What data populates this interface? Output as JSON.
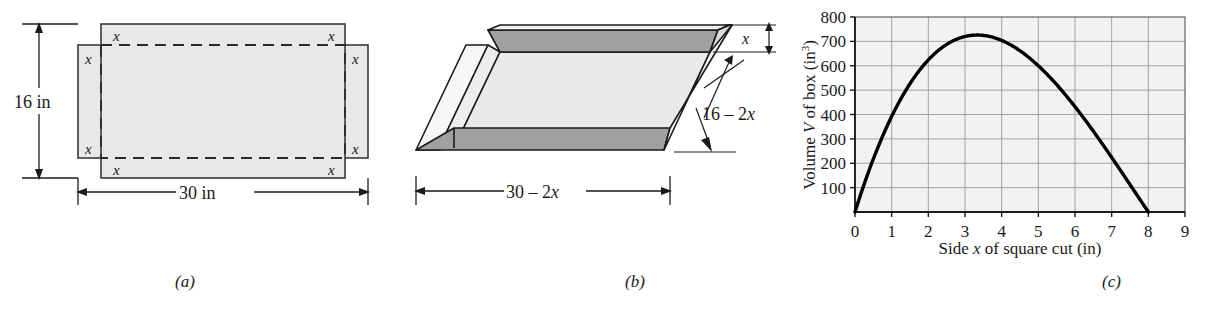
{
  "figure": {
    "caption_a": "(a)",
    "caption_b": "(b)",
    "caption_c": "(c)"
  },
  "panel_a": {
    "title": "flat sheet with squares cut from corners",
    "height_label": "16 in",
    "width_label": "30 in",
    "corner_labels": [
      "x",
      "x",
      "x",
      "x",
      "x",
      "x",
      "x",
      "x"
    ],
    "colors": {
      "fill": "#e8e8e8",
      "stroke": "#3a3a3a",
      "dash": "#2a2a2a"
    }
  },
  "panel_b": {
    "title": "open box folded from sheet",
    "height_label": "x",
    "depth_label": "16 – 2x",
    "depth_label_num": "16",
    "depth_label_minus": " – 2",
    "depth_label_var": "x",
    "width_label": "30 – 2x",
    "width_label_num": "30",
    "width_label_minus": " – 2",
    "width_label_var": "x",
    "colors": {
      "top_face": "#e9e9e9",
      "wall_face": "#a0a0a0",
      "outer_face": "#f2f2f2",
      "stroke": "#1a1a1a"
    }
  },
  "chart_data": {
    "type": "line",
    "title": "",
    "xlabel": "Side x of square cut (in)",
    "xlabel_pre": "Side ",
    "xlabel_var": "x",
    "xlabel_post": " of square cut (in)",
    "ylabel": "Volume V of box (in³)",
    "ylabel_pre": "Volume ",
    "ylabel_var": "V",
    "ylabel_post": " of box (in",
    "ylabel_sup": "3",
    "ylabel_end": ")",
    "xlim": [
      0,
      9
    ],
    "ylim": [
      0,
      800
    ],
    "xticks": [
      "0",
      "1",
      "2",
      "3",
      "4",
      "5",
      "6",
      "7",
      "8",
      "9"
    ],
    "yticks": [
      "100",
      "200",
      "300",
      "400",
      "500",
      "600",
      "700",
      "800"
    ],
    "grid": true,
    "legend": "none",
    "curve_formula": "V = x(30-2x)(16-2x)",
    "x": [
      0,
      0.25,
      0.5,
      0.75,
      1,
      1.25,
      1.5,
      1.75,
      2,
      2.25,
      2.5,
      2.75,
      3,
      3.25,
      3.5,
      3.75,
      4,
      4.25,
      4.5,
      4.75,
      5,
      5.25,
      5.5,
      5.75,
      6,
      6.25,
      6.5,
      6.75,
      7,
      7.25,
      7.5,
      7.75,
      8
    ],
    "y": [
      0,
      108.1,
      203.0,
      285.4,
      356.0,
      415.3,
      464.0,
      502.7,
      532.0,
      552.6,
      565.0,
      569.9,
      568.0,
      560.0,
      546.5,
      528.2,
      505.8,
      479.9,
      451.1,
      420.2,
      387.8,
      354.5,
      321.0,
      287.9,
      255.9,
      225.6,
      197.7,
      172.8,
      151.5,
      134.5,
      122.4,
      115.9,
      115.5
    ],
    "curve_points_scaled": "exact values computed from V = x(30-2x)(16-2x)",
    "max_point": {
      "x": 3.33,
      "y": 725.5
    },
    "zeros": [
      0,
      8
    ],
    "colors": {
      "curve": "#000000",
      "grid": "#9a9a9a",
      "axis": "#1a1a1a",
      "plot_bg": "#f2f2f2"
    }
  }
}
